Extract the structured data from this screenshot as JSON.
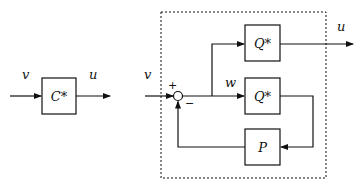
{
  "left_diagram": {
    "input_label": "v",
    "output_label": "u",
    "block_label": "C*"
  },
  "right_diagram": {
    "input_label": "v",
    "output_label": "u",
    "internal_signal_label": "w",
    "plus_sign": "+",
    "minus_sign": "−",
    "top_block_label": "Q*",
    "middle_block_label": "Q*",
    "feedback_block_label": "P"
  }
}
